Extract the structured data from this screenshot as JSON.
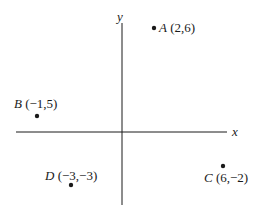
{
  "diagram": {
    "type": "coordinate-plane",
    "axes": {
      "x_label": "x",
      "y_label": "y"
    },
    "points": [
      {
        "name": "A",
        "coords": "(2,6)",
        "x": 2,
        "y": 6
      },
      {
        "name": "B",
        "coords": "(−1,5)",
        "x": -1,
        "y": 5
      },
      {
        "name": "C",
        "coords": "(6,−2)",
        "x": 6,
        "y": -2
      },
      {
        "name": "D",
        "coords": "(−3,−3)",
        "x": -3,
        "y": -3
      }
    ],
    "colors": {
      "ink": "#1a1a1a",
      "background": "#ffffff"
    }
  }
}
